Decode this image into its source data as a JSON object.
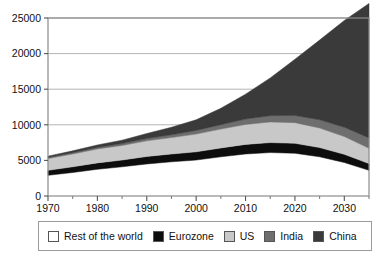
{
  "chart_data": {
    "type": "area",
    "stacked": true,
    "title": "",
    "subtitle": "",
    "xlabel": "",
    "ylabel": "",
    "xlim": [
      1970,
      2035
    ],
    "ylim": [
      0,
      25000
    ],
    "yticks": [
      0,
      5000,
      10000,
      15000,
      20000,
      25000
    ],
    "ytick_labels": [
      "0",
      "5000",
      "10000",
      "15000",
      "20000",
      "25000"
    ],
    "xticks": [
      1970,
      1980,
      1990,
      2000,
      2010,
      2020,
      2030
    ],
    "xtick_labels": [
      "1970",
      "1980",
      "1990",
      "2000",
      "2010",
      "2020",
      "2030"
    ],
    "minor_xticks": [
      1975,
      1985,
      1995,
      2005,
      2015,
      2025,
      2035
    ],
    "grid": "horizontal",
    "legend_position": "bottom",
    "x": [
      1970,
      1975,
      1980,
      1985,
      1990,
      1995,
      2000,
      2005,
      2010,
      2015,
      2020,
      2025,
      2030,
      2035
    ],
    "series": [
      {
        "name": "Rest of the world",
        "color": "#ffffff",
        "values": [
          2900,
          3300,
          3750,
          4100,
          4500,
          4800,
          5050,
          5500,
          5900,
          6100,
          6000,
          5500,
          4700,
          3600
        ]
      },
      {
        "name": "Eurozone",
        "color": "#0d0d0d",
        "values": [
          700,
          800,
          900,
          950,
          1050,
          1100,
          1150,
          1250,
          1350,
          1400,
          1400,
          1300,
          1150,
          950
        ]
      },
      {
        "name": "US",
        "color": "#c8c8c8",
        "values": [
          1650,
          1800,
          1950,
          2050,
          2200,
          2300,
          2500,
          2650,
          2800,
          2900,
          2900,
          2750,
          2500,
          2150
        ]
      },
      {
        "name": "India",
        "color": "#6e6e6e",
        "values": [
          150,
          180,
          220,
          260,
          320,
          400,
          500,
          620,
          750,
          880,
          1000,
          1150,
          1300,
          1450
        ]
      },
      {
        "name": "China",
        "color": "#3a3a3a",
        "values": [
          200,
          260,
          350,
          480,
          700,
          1050,
          1500,
          2300,
          3500,
          5300,
          7900,
          11200,
          15000,
          18900
        ]
      }
    ]
  },
  "legend": {
    "items": [
      {
        "label": "Rest of the world",
        "color": "#ffffff"
      },
      {
        "label": "Eurozone",
        "color": "#0d0d0d"
      },
      {
        "label": "US",
        "color": "#c8c8c8"
      },
      {
        "label": "India",
        "color": "#6e6e6e"
      },
      {
        "label": "China",
        "color": "#3a3a3a"
      }
    ]
  }
}
